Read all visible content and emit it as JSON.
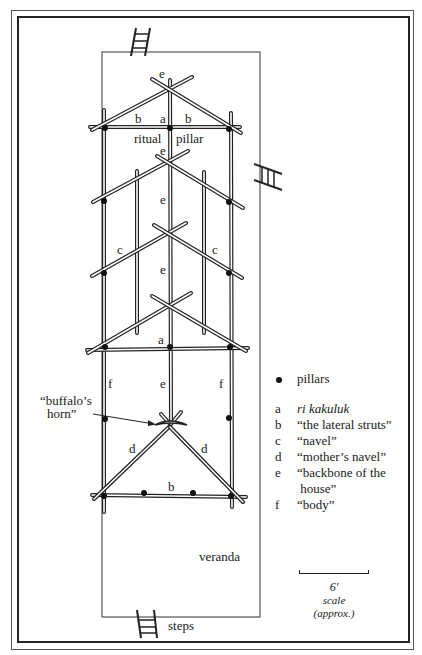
{
  "diagram": {
    "type": "architectural house-frame plan",
    "labels": {
      "top_apex_e": "e",
      "b_left_top": "b",
      "a_top": "a",
      "b_right_top": "b",
      "ritual": "ritual",
      "pillar": "pillar",
      "e_second": "e",
      "e_third": "e",
      "c_left": "c",
      "e_fourth": "e",
      "c_right": "c",
      "a_lower": "a",
      "f_left": "f",
      "e_lower": "e",
      "f_right": "f",
      "buffalo_horn_line1": "“buffalo’s",
      "buffalo_horn_line2": "horn”",
      "d_left": "d",
      "d_right": "d",
      "b_bottom": "b",
      "veranda": "veranda",
      "steps": "steps"
    },
    "legend": {
      "pillars": "pillars",
      "items": [
        {
          "key": "a",
          "text": "ri kakuluk",
          "italic": true
        },
        {
          "key": "b",
          "text": "“the lateral struts”"
        },
        {
          "key": "c",
          "text": "“navel”"
        },
        {
          "key": "d",
          "text": "“mother’s navel”"
        },
        {
          "key": "e",
          "text": "“backbone of the"
        },
        {
          "key": "",
          "text": " house”"
        },
        {
          "key": "f",
          "text": "“body”"
        }
      ]
    },
    "scale": {
      "value": "6′",
      "label": "scale",
      "note": "(approx.)"
    },
    "colors": {
      "ink": "#1a1a1a",
      "paper": "#ffffff"
    }
  }
}
